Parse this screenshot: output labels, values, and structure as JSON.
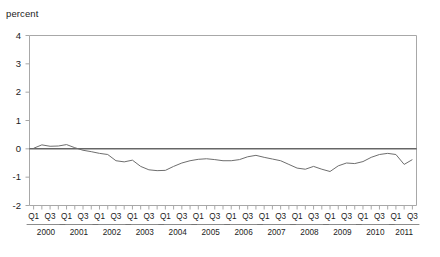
{
  "figure": {
    "unit_label": "percent",
    "cropped_title": "",
    "line_color": "#6e6e6e",
    "zero_line_color": "#1b1b1b",
    "frame_color": "#a8a8a8"
  },
  "chart_data": {
    "type": "line",
    "title": "",
    "subtitle": "",
    "xlabel": "",
    "ylabel": "percent",
    "ylim": [
      -2,
      4
    ],
    "yticks": [
      4,
      3,
      2,
      1,
      0,
      -1,
      -2
    ],
    "ytick_labels": [
      "4",
      "3",
      "2",
      "1",
      "0",
      "-1",
      "-2"
    ],
    "grid": false,
    "legend": "none",
    "zero_reference_line": 0,
    "quarter_tick_labels": [
      "Q1",
      "Q3"
    ],
    "years": [
      "2000",
      "2001",
      "2002",
      "2003",
      "2004",
      "2005",
      "2006",
      "2007",
      "2008",
      "2009",
      "2010",
      "2011"
    ],
    "x": [
      "2000Q1",
      "2000Q2",
      "2000Q3",
      "2000Q4",
      "2001Q1",
      "2001Q2",
      "2001Q3",
      "2001Q4",
      "2002Q1",
      "2002Q2",
      "2002Q3",
      "2002Q4",
      "2003Q1",
      "2003Q2",
      "2003Q3",
      "2003Q4",
      "2004Q1",
      "2004Q2",
      "2004Q3",
      "2004Q4",
      "2005Q1",
      "2005Q2",
      "2005Q3",
      "2005Q4",
      "2006Q1",
      "2006Q2",
      "2006Q3",
      "2006Q4",
      "2007Q1",
      "2007Q2",
      "2007Q3",
      "2007Q4",
      "2008Q1",
      "2008Q2",
      "2008Q3",
      "2008Q4",
      "2009Q1",
      "2009Q2",
      "2009Q3",
      "2009Q4",
      "2010Q1",
      "2010Q2",
      "2010Q3",
      "2010Q4",
      "2011Q1",
      "2011Q2",
      "2011Q3"
    ],
    "values": [
      0.02,
      0.14,
      0.09,
      0.1,
      0.15,
      0.04,
      -0.05,
      -0.1,
      -0.16,
      -0.2,
      -0.42,
      -0.46,
      -0.4,
      -0.62,
      -0.74,
      -0.77,
      -0.76,
      -0.62,
      -0.5,
      -0.42,
      -0.37,
      -0.35,
      -0.38,
      -0.42,
      -0.42,
      -0.38,
      -0.28,
      -0.23,
      -0.3,
      -0.36,
      -0.42,
      -0.55,
      -0.68,
      -0.72,
      -0.62,
      -0.72,
      -0.8,
      -0.6,
      -0.5,
      -0.52,
      -0.45,
      -0.3,
      -0.2,
      -0.16,
      -0.2,
      -0.55,
      -0.38
    ]
  }
}
